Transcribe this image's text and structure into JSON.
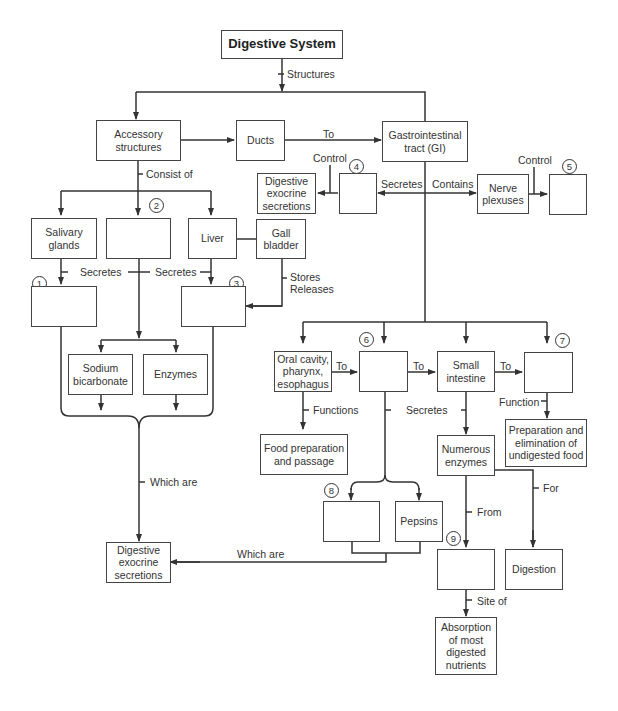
{
  "diagram": {
    "title": "Digestive System",
    "boxes": {
      "accessory": "Accessory\nstructures",
      "ducts": "Ducts",
      "gi": "Gastrointestinal\ntract (GI)",
      "dig_exo_top": "Digestive\nexocrine\nsecretions",
      "nerve": "Nerve\nplexuses",
      "salivary": "Salivary\nglands",
      "liver": "Liver",
      "gall": "Gall\nbladder",
      "sodium": "Sodium\nbicarbonate",
      "enzymes": "Enzymes",
      "oral": "Oral cavity,\npharynx,\nesophagus",
      "small": "Small\nintestine",
      "food_prep": "Food preparation\nand passage",
      "numerous": "Numerous\nenzymes",
      "prep_elim": "Preparation and\nelimination of\nundigested food",
      "pepsins": "Pepsins",
      "digestion": "Digestion",
      "absorption": "Absorption\nof most\ndigested\nnutrients",
      "dig_exo_bottom": "Digestive\nexocrine\nsecretions"
    },
    "labels": {
      "structures": "Structures",
      "to_gi": "To",
      "consist_of": "Consist of",
      "control_4": "Control",
      "secretes_gi": "Secretes",
      "contains": "Contains",
      "control_5": "Control",
      "secretes_1": "Secretes",
      "secretes_2": "Secretes",
      "stores_releases": "Stores\nReleases",
      "which_are_left": "Which are",
      "to_oral": "To",
      "to_6": "To",
      "to_small": "To",
      "functions": "Functions",
      "secretes_stomach": "Secretes",
      "function_7": "Function",
      "from": "From",
      "for": "For",
      "which_are_bottom": "Which are",
      "site_of": "Site of"
    },
    "blanks": {
      "n1": "1",
      "n2": "2",
      "n3": "3",
      "n4": "4",
      "n5": "5",
      "n6": "6",
      "n7": "7",
      "n8": "8",
      "n9": "9"
    }
  }
}
